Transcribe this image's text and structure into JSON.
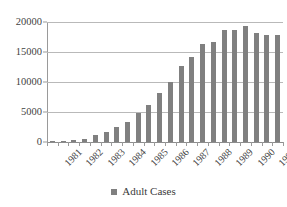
{
  "chart_data": {
    "type": "bar",
    "title": "",
    "subtitle": "",
    "xlabel": "",
    "ylabel": "",
    "ylim": [
      0,
      20000
    ],
    "yticks": [
      0,
      5000,
      10000,
      15000,
      20000
    ],
    "ytick_labels": [
      "0",
      "5000",
      "10000",
      "15000",
      "20000"
    ],
    "grid": true,
    "legend_position": "bottom",
    "legend": [
      "Adult Cases"
    ],
    "bar_color": "#808080",
    "categories": [
      "1981 H1",
      "1981 H2",
      "1982 H1",
      "1982 H2",
      "1983 H1",
      "1983 H2",
      "1984 H1",
      "1984 H2",
      "1985 H1",
      "1985 H2",
      "1986 H1",
      "1986 H2",
      "1987 H1",
      "1987 H2",
      "1988 H1",
      "1988 H2",
      "1989 H1",
      "1989 H2",
      "1990 H1",
      "1990 H2",
      "1991 H1",
      "1991 H2"
    ],
    "xtick_labels": [
      "1981",
      "1982",
      "1983",
      "1984",
      "1985",
      "1986",
      "1987",
      "1988",
      "1989",
      "1990",
      "1991"
    ],
    "series": [
      {
        "name": "Adult Cases",
        "values": [
          60,
          120,
          300,
          420,
          1200,
          1650,
          2500,
          3400,
          4900,
          6250,
          8200,
          10000,
          12700,
          14200,
          16300,
          16650,
          18700,
          18650,
          19400,
          18150,
          17900,
          17900
        ]
      }
    ]
  },
  "legend": {
    "label": "Adult Cases"
  },
  "colors": {
    "bar": "#808080",
    "grid": "#b9b9b9",
    "axis": "#9a9a9a",
    "text": "#3a3a3a",
    "background": "#ffffff"
  }
}
